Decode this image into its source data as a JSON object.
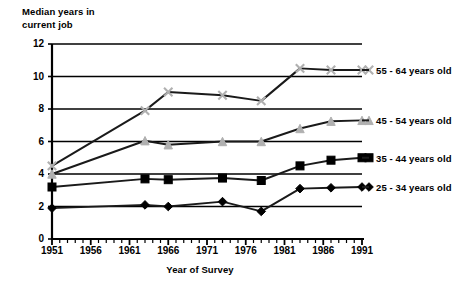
{
  "chart_data": {
    "type": "line",
    "title": "Median years in\ncurrent job",
    "xlabel": "Year of Survey",
    "ylabel": "",
    "xlim": [
      1951,
      1991
    ],
    "ylim": [
      0,
      12
    ],
    "yticks": [
      0,
      2,
      4,
      6,
      8,
      10,
      12
    ],
    "ytick_labels": [
      "0",
      "2",
      "4",
      "6",
      "8",
      "10",
      "12"
    ],
    "xticks": [
      1951,
      1956,
      1961,
      1966,
      1971,
      1976,
      1981,
      1986,
      1991
    ],
    "xtick_labels": [
      "1951",
      "1956",
      "1961",
      "1966",
      "1971",
      "1976",
      "1981",
      "1986",
      "1991"
    ],
    "x_minor_tick_step": 1,
    "grid": "horizontal",
    "legend_position": "right-of-plot",
    "series": [
      {
        "name": "55 - 64 years old",
        "marker": "x",
        "x": [
          1951,
          1963,
          1966,
          1973,
          1978,
          1983,
          1987,
          1991
        ],
        "y": [
          4.5,
          7.9,
          9.05,
          8.85,
          8.5,
          10.5,
          10.4,
          10.4
        ]
      },
      {
        "name": "45 - 54 years old",
        "marker": "triangle",
        "x": [
          1951,
          1963,
          1966,
          1973,
          1978,
          1983,
          1987,
          1991
        ],
        "y": [
          4.0,
          6.05,
          5.8,
          6.0,
          6.0,
          6.8,
          7.25,
          7.3
        ]
      },
      {
        "name": "35 - 44 years old",
        "marker": "square",
        "x": [
          1951,
          1963,
          1966,
          1973,
          1978,
          1983,
          1987,
          1991
        ],
        "y": [
          3.2,
          3.7,
          3.65,
          3.75,
          3.6,
          4.5,
          4.85,
          5.0
        ]
      },
      {
        "name": "25 - 34 years old",
        "marker": "diamond",
        "x": [
          1951,
          1963,
          1966,
          1973,
          1978,
          1983,
          1987,
          1991
        ],
        "y": [
          1.9,
          2.1,
          2.0,
          2.3,
          1.7,
          3.1,
          3.15,
          3.2
        ]
      }
    ]
  },
  "colors": {
    "axis": "#000000",
    "grid": "#000000",
    "line": "#1a1a1a",
    "marker_light": "#b0b0b0",
    "marker_dark": "#000000",
    "background": "#ffffff"
  },
  "legend": [
    {
      "label": "55 - 64 years old"
    },
    {
      "label": "45 - 54 years old"
    },
    {
      "label": "35 - 44 years old"
    },
    {
      "label": "25 - 34 years old"
    }
  ]
}
